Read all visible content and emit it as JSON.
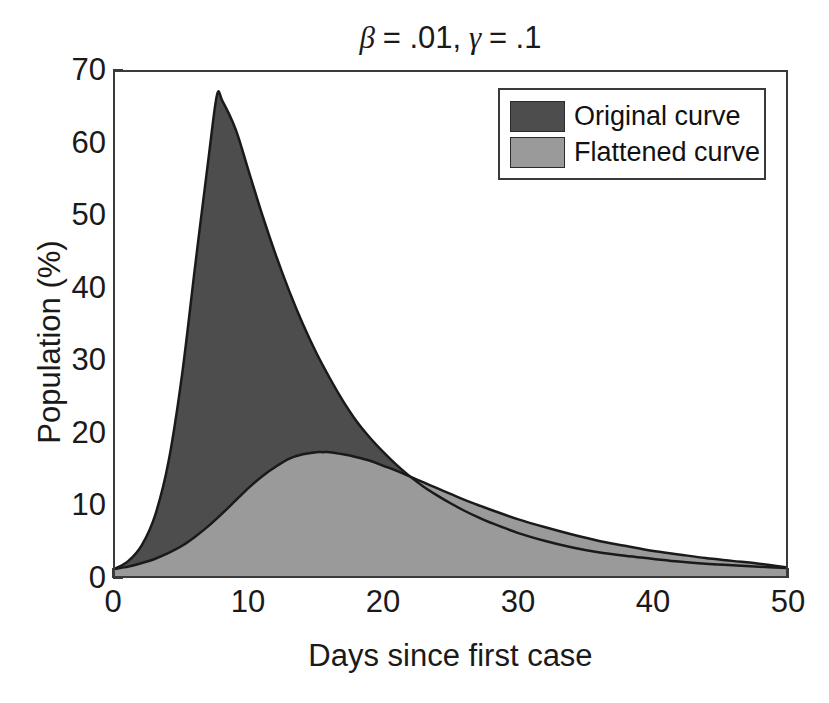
{
  "chart_data": {
    "type": "area",
    "title": "β = .01, γ = .1",
    "title_parts": {
      "beta": "β",
      "beta_value": "= .01,",
      "gamma": "γ",
      "gamma_value": "= .1"
    },
    "xlabel": "Days since first case",
    "ylabel": "Population (%)",
    "xlim": [
      0,
      50
    ],
    "ylim": [
      0,
      70
    ],
    "xticks": [
      0,
      10,
      20,
      30,
      40,
      50
    ],
    "yticks": [
      0,
      10,
      20,
      30,
      40,
      50,
      60,
      70
    ],
    "grid": false,
    "legend_position": "upper right",
    "colors": {
      "original": "#4d4d4d",
      "flattened": "#9a9a9a",
      "axis": "#3a3a3a",
      "outline": "#1a1a1a"
    },
    "series": [
      {
        "name": "Original curve",
        "color": "#4d4d4d",
        "peak_day": 7.6,
        "peak_value": 67,
        "x": [
          0,
          1,
          2,
          3,
          4,
          5,
          6,
          7,
          7.6,
          8,
          9,
          10,
          11,
          12,
          13,
          14,
          15,
          16,
          17,
          18,
          19,
          20,
          21,
          22,
          23,
          24,
          25,
          26,
          27,
          28,
          30,
          32,
          34,
          36,
          38,
          40,
          42,
          44,
          46,
          48,
          50
        ],
        "values": [
          1.0,
          2.1,
          4.3,
          8.5,
          16.0,
          28.0,
          43.5,
          58.5,
          66.8,
          66.0,
          62.0,
          56.0,
          50.0,
          44.5,
          39.5,
          35.0,
          31.0,
          27.5,
          24.3,
          21.5,
          19.2,
          17.2,
          15.4,
          13.8,
          12.4,
          11.2,
          10.1,
          9.1,
          8.2,
          7.4,
          6.0,
          4.9,
          4.0,
          3.3,
          2.8,
          2.4,
          2.0,
          1.7,
          1.5,
          1.3,
          1.1
        ]
      },
      {
        "name": "Flattened curve",
        "color": "#9a9a9a",
        "peak_day": 15.5,
        "peak_value": 17.2,
        "x": [
          0,
          1,
          2,
          3,
          4,
          5,
          6,
          7,
          8,
          9,
          10,
          11,
          12,
          13,
          14,
          15,
          15.5,
          16,
          17,
          18,
          19,
          20,
          21,
          22,
          23,
          24,
          25,
          26,
          27,
          28,
          30,
          32,
          34,
          36,
          38,
          40,
          42,
          44,
          46,
          48,
          50
        ],
        "values": [
          1.0,
          1.3,
          1.8,
          2.4,
          3.2,
          4.2,
          5.5,
          7.0,
          8.7,
          10.5,
          12.3,
          13.9,
          15.2,
          16.3,
          16.9,
          17.2,
          17.2,
          17.2,
          16.9,
          16.5,
          16.0,
          15.3,
          14.6,
          13.8,
          13.0,
          12.2,
          11.4,
          10.6,
          9.9,
          9.2,
          7.9,
          6.8,
          5.8,
          4.9,
          4.2,
          3.5,
          3.0,
          2.5,
          2.1,
          1.7,
          1.2
        ]
      }
    ],
    "legend": [
      {
        "label": "Original curve",
        "color": "#4d4d4d"
      },
      {
        "label": "Flattened curve",
        "color": "#9a9a9a"
      }
    ]
  }
}
